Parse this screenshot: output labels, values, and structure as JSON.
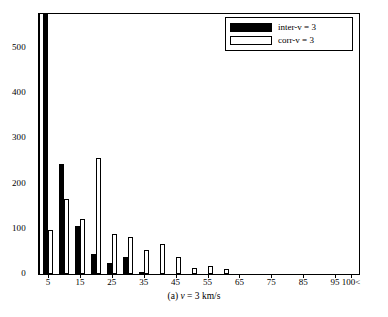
{
  "chart_data": {
    "type": "bar",
    "title": "",
    "subtitle": "",
    "caption": "(a) v = 3 km/s",
    "caption_prefix": "(a) ",
    "caption_variable": "v",
    "caption_rest": " = 3 km/s",
    "xlabel": "",
    "ylabel": "",
    "xlim": [
      2.5,
      102.5
    ],
    "ylim": [
      0,
      575
    ],
    "grid": false,
    "legend_position": "top-right",
    "bin_width": 5,
    "ytick_values": [
      0,
      100,
      200,
      300,
      400,
      500
    ],
    "ytick_labels": [
      "0",
      "100",
      "200",
      "300",
      "400",
      "500"
    ],
    "xtick_values": [
      5,
      15,
      25,
      35,
      45,
      55,
      65,
      75,
      85,
      95,
      100
    ],
    "xtick_labels": [
      "5",
      "15",
      "25",
      "35",
      "45",
      "55",
      "65",
      "75",
      "85",
      "95",
      "100<"
    ],
    "categories": [
      5,
      10,
      15,
      20,
      25,
      30,
      35,
      40,
      45,
      50,
      55,
      60,
      65,
      70,
      75,
      80,
      85,
      90,
      95,
      100
    ],
    "series": [
      {
        "name": "inter-v = 3",
        "color": "#000000",
        "fill": "solid-black",
        "values": [
          620,
          243,
          106,
          44,
          24,
          37,
          3,
          0,
          0,
          0,
          0,
          0,
          0,
          0,
          0,
          0,
          0,
          0,
          0,
          0
        ],
        "clipped_at_top": [
          5
        ]
      },
      {
        "name": "corr-v = 3",
        "color": "#ffffff",
        "fill": "white-outlined",
        "values": [
          97,
          167,
          121,
          256,
          89,
          81,
          53,
          67,
          37,
          13,
          17,
          10,
          0,
          0,
          0,
          0,
          0,
          0,
          0,
          0
        ],
        "clipped_at_top": []
      }
    ]
  },
  "legend": {
    "items": [
      {
        "label": "inter-v = 3",
        "swatch": "black"
      },
      {
        "label": "corr-v = 3",
        "swatch": "white"
      }
    ]
  }
}
